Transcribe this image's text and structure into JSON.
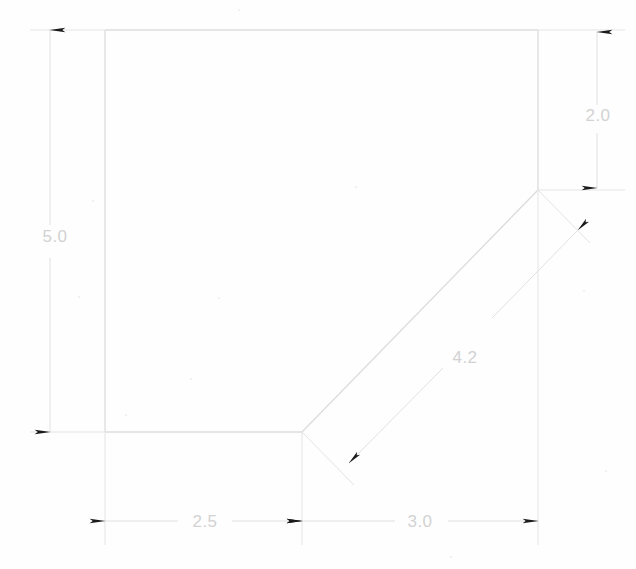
{
  "drawing": {
    "title": "Dimensioned polygon outline with chamfered corner",
    "background_color": "#fefefe",
    "outline_color": "#dcdcdc",
    "dimension_line_color": "#e0e0e0",
    "arrow_color": "#1a1a1a",
    "text_color": "#d2d2d2",
    "shape": {
      "name": "chamfered-rectangle",
      "vertices": [
        {
          "label": "top-left",
          "x": 105,
          "y": 30
        },
        {
          "label": "top-right",
          "x": 538,
          "y": 30
        },
        {
          "label": "chamfer-top",
          "x": 538,
          "y": 190
        },
        {
          "label": "chamfer-bottom",
          "x": 302,
          "y": 432
        },
        {
          "label": "bottom-left",
          "x": 105,
          "y": 432
        }
      ]
    },
    "dimensions": [
      {
        "name": "height-left",
        "value": "5.0",
        "orientation": "vertical",
        "text_x": 55,
        "text_y": 242,
        "line_x": 50,
        "from_y": 30,
        "to_y": 432,
        "arrows": "both-outward"
      },
      {
        "name": "height-right-chamfer",
        "value": "2.0",
        "orientation": "vertical",
        "text_x": 598,
        "text_y": 121,
        "line_x": 597,
        "from_y": 30,
        "to_y": 190,
        "arrows": "both-inward"
      },
      {
        "name": "width-left-segment",
        "value": "2.5",
        "orientation": "horizontal",
        "text_x": 205,
        "text_y": 527,
        "line_y": 521,
        "from_x": 105,
        "to_x": 302,
        "arrows": "both-inward"
      },
      {
        "name": "width-right-segment",
        "value": "3.0",
        "orientation": "horizontal",
        "text_x": 420,
        "text_y": 527,
        "line_y": 521,
        "from_x": 302,
        "to_x": 538,
        "arrows": "both-inward"
      },
      {
        "name": "chamfer-diagonal",
        "value": "4.2",
        "orientation": "diagonal",
        "text_x": 465,
        "text_y": 363,
        "from_x": 573,
        "from_y": 225,
        "to_x": 338,
        "to_y": 467,
        "arrows": "both-inward"
      }
    ]
  }
}
